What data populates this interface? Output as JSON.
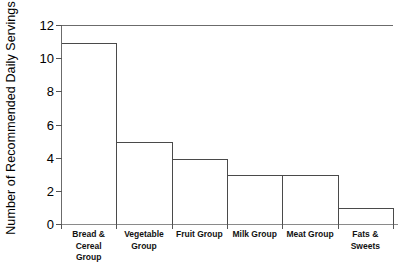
{
  "chart_data": {
    "type": "bar",
    "title": "",
    "subtitle": "",
    "xlabel": "",
    "ylabel": "Number of Recommended Daily Servings",
    "categories": [
      "Bread & Cereal Group",
      "Vegetable Group",
      "Fruit Group",
      "Milk Group",
      "Meat Group",
      "Fats & Sweets"
    ],
    "category_lines": [
      [
        "Bread &",
        "Cereal",
        "Group"
      ],
      [
        "Vegetable",
        "Group"
      ],
      [
        "Fruit Group"
      ],
      [
        "Milk Group"
      ],
      [
        "Meat Group"
      ],
      [
        "Fats &",
        "Sweets"
      ]
    ],
    "values": [
      11,
      5,
      4,
      3,
      3,
      1
    ],
    "ylim": [
      0,
      12
    ],
    "ytick_values": [
      0,
      2,
      4,
      6,
      8,
      10,
      12
    ],
    "ytick_labels": [
      "0",
      "2",
      "4",
      "6",
      "8",
      "10",
      "12"
    ],
    "grid": false,
    "legend": null,
    "bar_fill_color": "#ffffff",
    "bar_edge_color": "#4a4a4a",
    "axis_color": "#6b6b6b",
    "background_color": "#ffffff",
    "text_color": "#000000"
  }
}
